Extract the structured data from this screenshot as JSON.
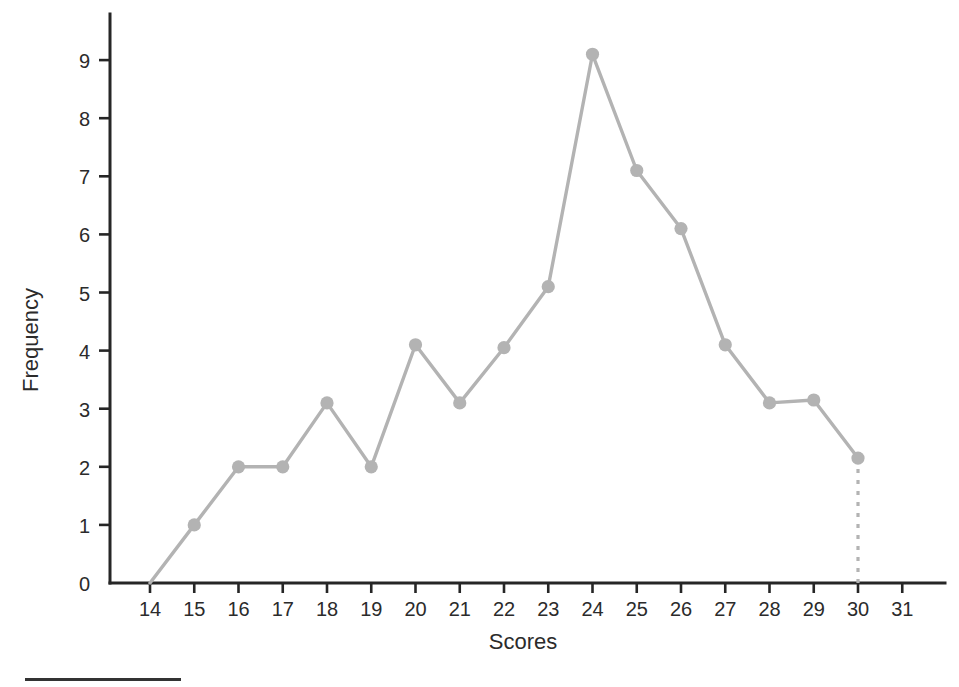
{
  "figure": {
    "background_color": "#ffffff",
    "series_color": "#b3b3b3",
    "axis_color": "#262626",
    "text_color": "#2b2b2b"
  },
  "axes": {
    "x_title": "Scores",
    "y_title": "Frequency",
    "x_tick_labels": [
      "14",
      "15",
      "16",
      "17",
      "18",
      "19",
      "20",
      "21",
      "22",
      "23",
      "24",
      "25",
      "26",
      "27",
      "28",
      "29",
      "30",
      "31"
    ],
    "y_tick_labels": [
      "0",
      "1",
      "2",
      "3",
      "4",
      "5",
      "6",
      "7",
      "8",
      "9"
    ]
  },
  "footer": {
    "rule_color": "#333333"
  },
  "chart_data": {
    "type": "line",
    "title": "",
    "subtitle": "",
    "xlabel": "Scores",
    "ylabel": "Frequency",
    "xlim": [
      13.1,
      31.9
    ],
    "ylim": [
      0,
      9.8
    ],
    "grid": false,
    "legend": null,
    "markers": true,
    "marker_shape": "circle",
    "line_color": "#b3b3b3",
    "x": [
      14,
      15,
      16,
      17,
      18,
      19,
      20,
      21,
      22,
      23,
      24,
      25,
      26,
      27,
      28,
      29,
      30
    ],
    "values": [
      0,
      1,
      2,
      2,
      3.1,
      2,
      4.1,
      3.1,
      4.05,
      5.1,
      9.1,
      7.1,
      6.1,
      4.1,
      3.1,
      3.15,
      2.15
    ],
    "points": [
      {
        "x": 14,
        "y": 0,
        "marker": false
      },
      {
        "x": 15,
        "y": 1,
        "marker": true
      },
      {
        "x": 16,
        "y": 2,
        "marker": true
      },
      {
        "x": 17,
        "y": 2,
        "marker": true
      },
      {
        "x": 18,
        "y": 3.1,
        "marker": true
      },
      {
        "x": 19,
        "y": 2,
        "marker": true
      },
      {
        "x": 20,
        "y": 4.1,
        "marker": true
      },
      {
        "x": 21,
        "y": 3.1,
        "marker": true
      },
      {
        "x": 22,
        "y": 4.05,
        "marker": true
      },
      {
        "x": 23,
        "y": 5.1,
        "marker": true
      },
      {
        "x": 24,
        "y": 9.1,
        "marker": true
      },
      {
        "x": 25,
        "y": 7.1,
        "marker": true
      },
      {
        "x": 26,
        "y": 6.1,
        "marker": true
      },
      {
        "x": 27,
        "y": 4.1,
        "marker": true
      },
      {
        "x": 28,
        "y": 3.1,
        "marker": true
      },
      {
        "x": 29,
        "y": 3.15,
        "marker": true
      },
      {
        "x": 30,
        "y": 2.15,
        "marker": true
      }
    ],
    "annotations": [
      {
        "kind": "dotted-drop-line",
        "from": {
          "x": 30,
          "y": 2.15
        },
        "to": {
          "x": 30,
          "y": 0
        },
        "color": "#b3b3b3",
        "style": "dotted"
      }
    ],
    "x_ticks": [
      14,
      15,
      16,
      17,
      18,
      19,
      20,
      21,
      22,
      23,
      24,
      25,
      26,
      27,
      28,
      29,
      30,
      31
    ],
    "y_ticks": [
      0,
      1,
      2,
      3,
      4,
      5,
      6,
      7,
      8,
      9
    ]
  }
}
